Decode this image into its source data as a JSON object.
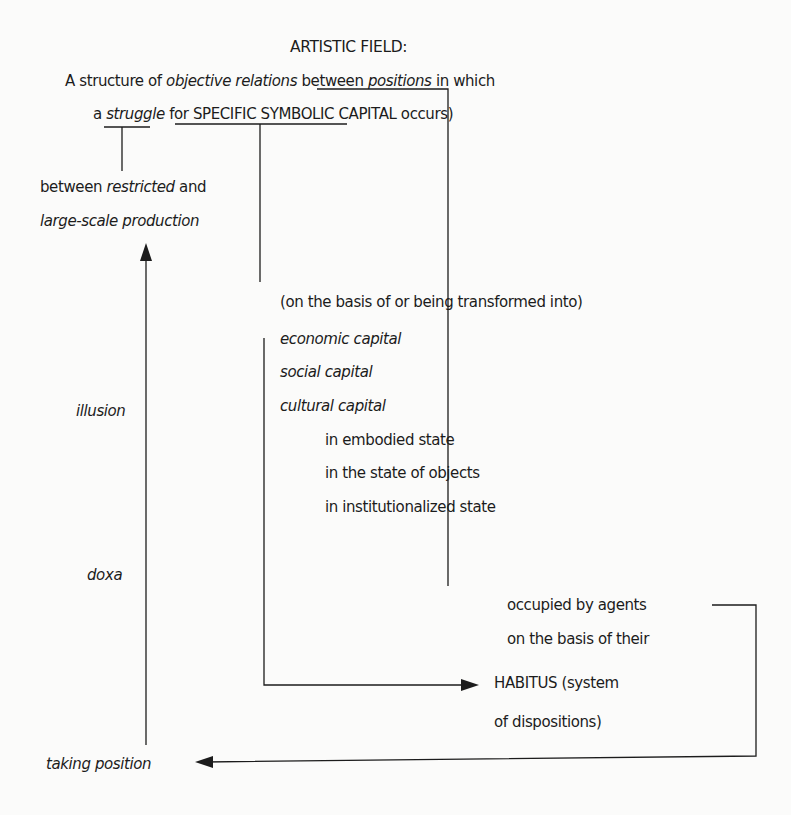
{
  "diagram": {
    "title": "ARTISTIC FIELD:",
    "definition": {
      "line1": [
        {
          "text": "A structure of ",
          "style": "normal"
        },
        {
          "text": "objective relations",
          "style": "italic"
        },
        {
          "text": " between ",
          "style": "normal"
        },
        {
          "text": "positions",
          "style": "italic-underline"
        },
        {
          "text": " in which",
          "style": "normal"
        }
      ],
      "line2": [
        {
          "text": "a ",
          "style": "normal"
        },
        {
          "text": "struggle",
          "style": "italic-underline"
        },
        {
          "text": " for ",
          "style": "normal"
        },
        {
          "text": "SPECIFIC SYMBOLIC CAPITAL",
          "style": "underline"
        },
        {
          "text": " occurs)",
          "style": "normal"
        }
      ]
    },
    "struggle_branch": {
      "line1_a": "between ",
      "line1_b": "restricted",
      "line1_c": " and",
      "line2": "large-scale production"
    },
    "capital_branch": {
      "intro": "(on the basis of or being transformed into)",
      "capitals": [
        "economic capital",
        "social capital",
        "cultural capital"
      ],
      "cultural_states": [
        "in embodied state",
        "in the state of objects",
        "in institutionalized state"
      ]
    },
    "positions_branch": {
      "lines": [
        "occupied by agents",
        "on the basis of their",
        "HABITUS (system",
        "of dispositions)"
      ]
    },
    "left_axis": {
      "labels": [
        "illusion",
        "doxa"
      ],
      "bottom": "taking position"
    },
    "colors": {
      "background": "#fbfbfa",
      "ink": "#1c1c1c"
    }
  }
}
